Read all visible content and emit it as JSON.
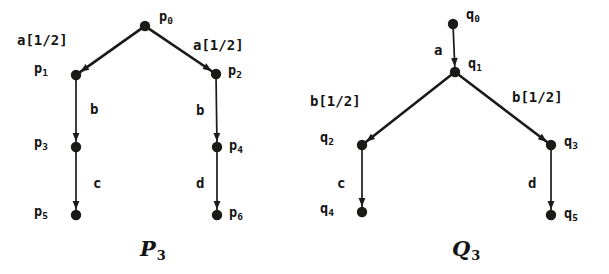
{
  "figure": {
    "background_color": "#ffffff",
    "ink_color": "#1a1a18",
    "diagrams": [
      {
        "id": "P3",
        "caption": "P",
        "caption_subscript": "3",
        "caption_x": 140,
        "caption_y": 238,
        "nodes": [
          {
            "id": "p0",
            "label": "p",
            "sub": "0",
            "x": 145,
            "y": 26,
            "label_x": 159,
            "label_y": 10
          },
          {
            "id": "p1",
            "label": "p",
            "sub": "1",
            "x": 76,
            "y": 75,
            "label_x": 34,
            "label_y": 62
          },
          {
            "id": "p2",
            "label": "p",
            "sub": "2",
            "x": 216,
            "y": 74,
            "label_x": 228,
            "label_y": 64
          },
          {
            "id": "p3",
            "label": "p",
            "sub": "3",
            "x": 76,
            "y": 147,
            "label_x": 34,
            "label_y": 136
          },
          {
            "id": "p4",
            "label": "p",
            "sub": "4",
            "x": 217,
            "y": 147,
            "label_x": 229,
            "label_y": 139
          },
          {
            "id": "p5",
            "label": "p",
            "sub": "5",
            "x": 76,
            "y": 215,
            "label_x": 34,
            "label_y": 205
          },
          {
            "id": "p6",
            "label": "p",
            "sub": "6",
            "x": 217,
            "y": 215,
            "label_x": 229,
            "label_y": 206
          }
        ],
        "edges": [
          {
            "from": "p0",
            "to": "p1",
            "label": "a[1/2]",
            "label_x": 17,
            "label_y": 33
          },
          {
            "from": "p0",
            "to": "p2",
            "label": "a[1/2]",
            "label_x": 193,
            "label_y": 38
          },
          {
            "from": "p1",
            "to": "p3",
            "label": "b",
            "label_x": 90,
            "label_y": 102
          },
          {
            "from": "p2",
            "to": "p4",
            "label": "b",
            "label_x": 196,
            "label_y": 103
          },
          {
            "from": "p3",
            "to": "p5",
            "label": "c",
            "label_x": 93,
            "label_y": 176
          },
          {
            "from": "p4",
            "to": "p6",
            "label": "d",
            "label_x": 196,
            "label_y": 176
          }
        ]
      },
      {
        "id": "Q3",
        "caption": "Q",
        "caption_subscript": "3",
        "caption_x": 452,
        "caption_y": 238,
        "nodes": [
          {
            "id": "q0",
            "label": "q",
            "sub": "0",
            "x": 453,
            "y": 24,
            "label_x": 466,
            "label_y": 8
          },
          {
            "id": "q1",
            "label": "q",
            "sub": "1",
            "x": 455,
            "y": 72,
            "label_x": 468,
            "label_y": 57
          },
          {
            "id": "q2",
            "label": "q",
            "sub": "2",
            "x": 362,
            "y": 145,
            "label_x": 320,
            "label_y": 131
          },
          {
            "id": "q3",
            "label": "q",
            "sub": "3",
            "x": 551,
            "y": 145,
            "label_x": 564,
            "label_y": 135
          },
          {
            "id": "q4",
            "label": "q",
            "sub": "4",
            "x": 362,
            "y": 212,
            "label_x": 320,
            "label_y": 202
          },
          {
            "id": "q5",
            "label": "q",
            "sub": "5",
            "x": 551,
            "y": 215,
            "label_x": 564,
            "label_y": 207
          }
        ],
        "edges": [
          {
            "from": "q0",
            "to": "q1",
            "label": "a",
            "label_x": 434,
            "label_y": 43
          },
          {
            "from": "q1",
            "to": "q2",
            "label": "b[1/2]",
            "label_x": 310,
            "label_y": 94
          },
          {
            "from": "q1",
            "to": "q3",
            "label": "b[1/2]",
            "label_x": 512,
            "label_y": 90
          },
          {
            "from": "q2",
            "to": "q4",
            "label": "c",
            "label_x": 337,
            "label_y": 176
          },
          {
            "from": "q3",
            "to": "q5",
            "label": "d",
            "label_x": 528,
            "label_y": 176
          }
        ]
      }
    ]
  }
}
